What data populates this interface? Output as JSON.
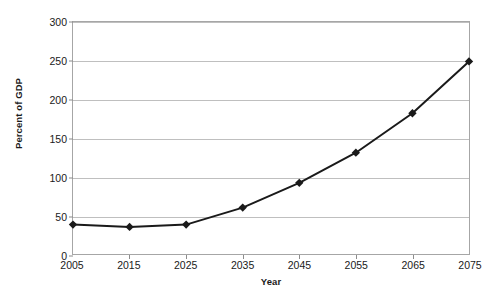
{
  "chart_data": {
    "type": "line",
    "title": "",
    "xlabel": "Year",
    "ylabel": "Percent of GDP",
    "x": [
      2005,
      2015,
      2025,
      2035,
      2045,
      2055,
      2065,
      2075
    ],
    "values": [
      38,
      35,
      38,
      60,
      92,
      131,
      182,
      249
    ],
    "series": [
      {
        "name": "Percent of GDP",
        "values": [
          38,
          35,
          38,
          60,
          92,
          131,
          182,
          249
        ],
        "color": "#1a1a1a",
        "marker": "diamond"
      }
    ],
    "xlim": [
      2005,
      2075
    ],
    "ylim": [
      0,
      300
    ],
    "xticks": [
      2005,
      2015,
      2025,
      2035,
      2045,
      2055,
      2065,
      2075
    ],
    "xtick_labels": [
      "2005",
      "2015",
      "2025",
      "2035",
      "2045",
      "2055",
      "2065",
      "2075"
    ],
    "yticks": [
      0,
      50,
      100,
      150,
      200,
      250,
      300
    ],
    "ytick_labels": [
      "0",
      "50",
      "100",
      "150",
      "200",
      "250",
      "300"
    ],
    "grid": "horizontal",
    "legend": "none",
    "line_color": "#1a1a1a",
    "grid_color": "#bfbfbf",
    "frame_color": "#a6a6a6",
    "background": "#ffffff"
  }
}
